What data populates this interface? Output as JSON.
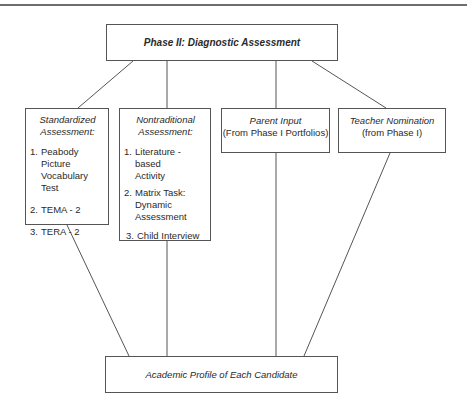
{
  "diagram": {
    "root": {
      "label": "Phase II: Diagnostic Assessment"
    },
    "branches": [
      {
        "title_line1": "Standardized",
        "title_line2": "Assessment:",
        "items": [
          {
            "num": "1.",
            "line1": "Peabody Picture",
            "line2": "Vocabulary Test"
          },
          {
            "num": "2.",
            "line1": "TEMA - 2"
          },
          {
            "num": "3.",
            "line1": "TERA - 2"
          }
        ]
      },
      {
        "title_line1": "Nontraditional",
        "title_line2": "Assessment:",
        "items": [
          {
            "num": "1.",
            "line1": "Literature - based",
            "line2": "Activity"
          },
          {
            "num": "2.",
            "line1": "Matrix Task:",
            "line2": "Dynamic",
            "line3": "Assessment"
          },
          {
            "num": "3.",
            "line1": "Child Interview"
          }
        ]
      },
      {
        "title": "Parent Input",
        "subtitle": "(From Phase I Portfolios)"
      },
      {
        "title": "Teacher Nomination",
        "subtitle": "(from Phase I)"
      }
    ],
    "sink": {
      "label": "Academic Profile of Each Candidate"
    },
    "colors": {
      "line": "#555555",
      "text": "#2a2a2a",
      "rule": "#6e6e6e",
      "background": "#ffffff"
    }
  }
}
